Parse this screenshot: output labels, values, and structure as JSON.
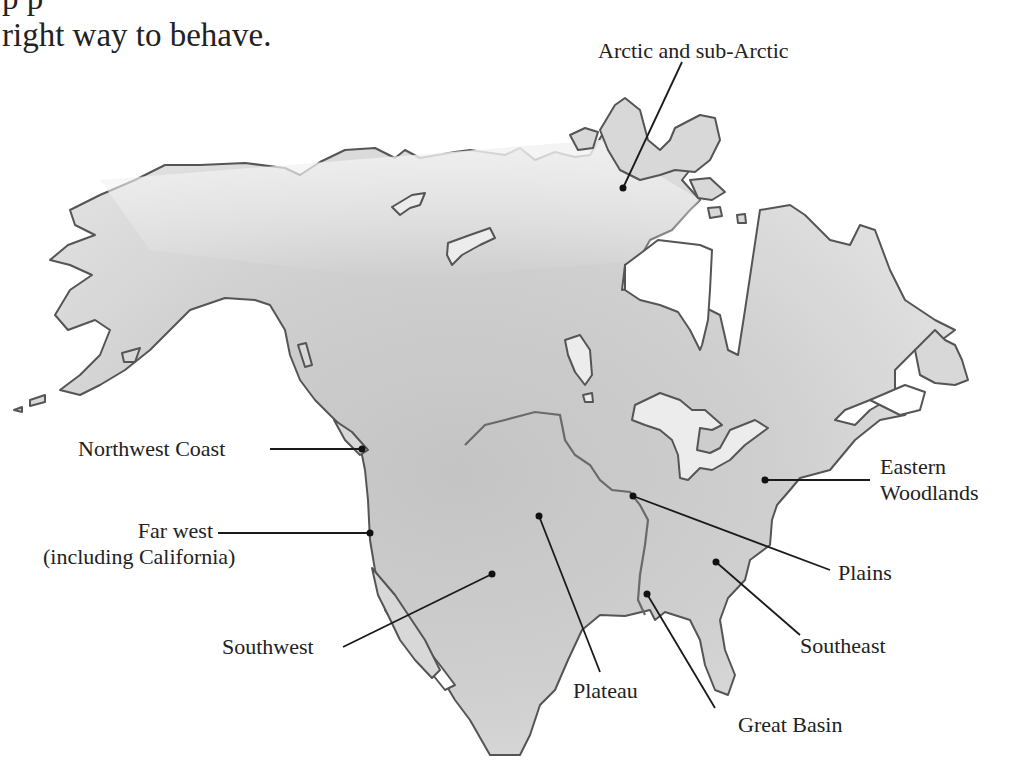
{
  "intro_text": {
    "line1": "p p",
    "line2": "right way to behave."
  },
  "map": {
    "subject": "North America culture areas",
    "colors": {
      "land_light": "#ededed",
      "land_dark": "#bdbdbd",
      "outline": "#555555",
      "leader": "#1a1a1a"
    },
    "labels": {
      "arctic": "Arctic and sub-Arctic",
      "northwest_coast": "Northwest Coast",
      "far_west_1": "Far west",
      "far_west_2": "(including California)",
      "eastern_woodlands_1": "Eastern",
      "eastern_woodlands_2": "Woodlands",
      "plains": "Plains",
      "southwest": "Southwest",
      "southeast": "Southeast",
      "plateau": "Plateau",
      "great_basin": "Great Basin"
    }
  }
}
